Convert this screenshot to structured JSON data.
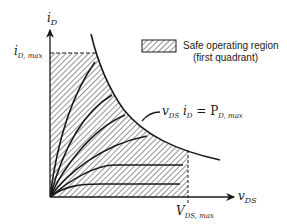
{
  "diagram": {
    "axes": {
      "y_label": "i",
      "y_label_sub": "D",
      "x_label": "v",
      "x_label_sub": "DS"
    },
    "limits": {
      "id_max_label": "i",
      "id_max_sub": "D, max",
      "vds_max_label": "V",
      "vds_max_sub": "DS, max",
      "power_label_a": "v",
      "power_label_a_sub": "DS",
      "power_label_b": " i",
      "power_label_b_sub": "D",
      "power_label_eq": " = P",
      "power_label_c_sub": "D, max"
    },
    "legend": {
      "line1": "Safe operating region",
      "line2": "(first quadrant)"
    },
    "colors": {
      "ink": "#1a1a1a",
      "hatch": "#444444",
      "background": "#ffffff"
    },
    "output_characteristic_count": 7
  }
}
